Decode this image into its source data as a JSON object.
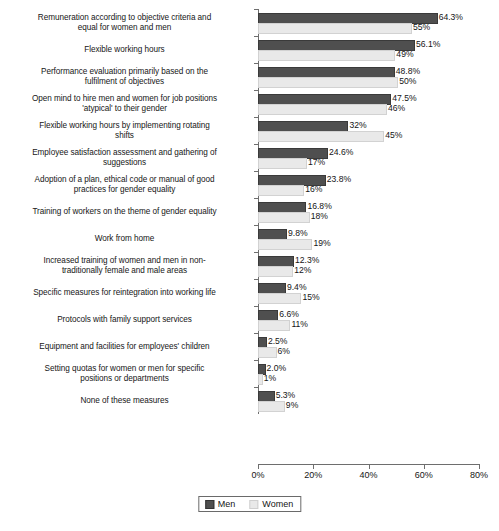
{
  "chart_data": {
    "type": "bar",
    "orientation": "horizontal",
    "title": "",
    "xlabel": "",
    "ylabel": "",
    "xlim": [
      0,
      80
    ],
    "xticks": [
      "0%",
      "20%",
      "40%",
      "60%",
      "80%"
    ],
    "xtick_values": [
      0,
      20,
      40,
      60,
      80
    ],
    "grid": false,
    "legend_position": "bottom",
    "categories": [
      "Remuneration according to objective criteria and equal for women and men",
      "Flexible working hours",
      "Performance evaluation primarily based on the fulfilment of objectives",
      "Open mind to hire men and women for job positions 'atypical' to their gender",
      "Flexible working hours by implementing rotating shifts",
      "Employee satisfaction assessment and gathering of suggestions",
      "Adoption of a plan, ethical code or manual of good practices for gender equality",
      "Training of workers on the theme of gender equality",
      "Work from home",
      "Increased training of women and men in non-traditionally female and male areas",
      "Specific measures for reintegration into working life",
      "Protocols with family support services",
      "Equipment and facilities for employees' children",
      "Setting quotas for women or men for specific positions or departments",
      "None of these measures"
    ],
    "category_lines": [
      [
        "Remuneration according to objective criteria and",
        "equal for women and men"
      ],
      [
        "Flexible working hours"
      ],
      [
        "Performance evaluation primarily based on the",
        "fulfilment of objectives"
      ],
      [
        "Open mind to hire men and women for job positions",
        "'atypical' to their gender"
      ],
      [
        "Flexible working hours by implementing rotating",
        "shifts"
      ],
      [
        "Employee satisfaction assessment and gathering of",
        "suggestions"
      ],
      [
        "Adoption of a plan, ethical code or manual of good",
        "practices for gender equality"
      ],
      [
        "Training of workers on the theme of gender equality"
      ],
      [
        "Work from home"
      ],
      [
        "Increased training of women and men in non-",
        "traditionally female and male areas"
      ],
      [
        "Specific measures for reintegration into working life"
      ],
      [
        "Protocols with family support services"
      ],
      [
        "Equipment and facilities for employees' children"
      ],
      [
        "Setting quotas for women or men for specific",
        "positions or departments"
      ],
      [
        "None of these measures"
      ]
    ],
    "series": [
      {
        "name": "Men",
        "color": "#4f4f4f",
        "values": [
          64.3,
          56.1,
          48.8,
          47.5,
          32,
          24.6,
          23.8,
          16.8,
          9.8,
          12.3,
          9.4,
          6.6,
          2.5,
          2.0,
          5.3
        ],
        "labels": [
          "64.3%",
          "56.1%",
          "48.8%",
          "47.5%",
          "32%",
          "24.6%",
          "23.8%",
          "16.8%",
          "9.8%",
          "12.3%",
          "9.4%",
          "6.6%",
          "2.5%",
          "2.0%",
          "5.3%"
        ]
      },
      {
        "name": "Women",
        "color": "#e9e9e9",
        "values": [
          55,
          49,
          50,
          46,
          45,
          17,
          16,
          18,
          19,
          12,
          15,
          11,
          6,
          1,
          9
        ],
        "labels": [
          "55%",
          "49%",
          "50%",
          "46%",
          "45%",
          "17%",
          "16%",
          "18%",
          "19%",
          "12%",
          "15%",
          "11%",
          "6%",
          "1%",
          "9%"
        ]
      }
    ],
    "legend": [
      "Men",
      "Women"
    ]
  },
  "legend": {
    "men_label": "Men",
    "women_label": "Women"
  },
  "caption": {
    "text": ""
  }
}
